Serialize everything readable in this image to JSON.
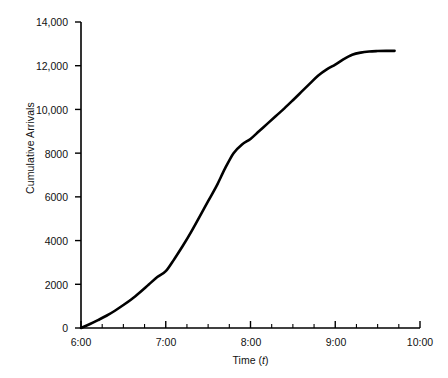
{
  "chart_data": {
    "type": "line",
    "title": "",
    "xlabel": "Time (t)",
    "xlabel_plain": "Time",
    "xlabel_variable": "t",
    "ylabel": "Cumulative Arrivals",
    "xlim": [
      6.0,
      10.0
    ],
    "ylim": [
      0,
      14000
    ],
    "grid": false,
    "legend": null,
    "line_color": "#000000",
    "axis_color": "#000000",
    "background_color": "#ffffff",
    "x_tick_labels": [
      "6:00",
      "7:00",
      "8:00",
      "9:00",
      "10:00"
    ],
    "x_tick_values": [
      6.0,
      7.0,
      8.0,
      9.0,
      10.0
    ],
    "x_minor_tick_interval_hours": 0.25,
    "y_tick_labels": [
      "0",
      "2000",
      "4000",
      "6000",
      "8000",
      "10,000",
      "12,000",
      "14,000"
    ],
    "y_tick_values": [
      0,
      2000,
      4000,
      6000,
      8000,
      10000,
      12000,
      14000
    ],
    "series": [
      {
        "name": "Cumulative Arrivals",
        "x": [
          6.0,
          6.1,
          6.2,
          6.3,
          6.4,
          6.5,
          6.6,
          6.7,
          6.8,
          6.9,
          7.0,
          7.1,
          7.2,
          7.3,
          7.4,
          7.5,
          7.6,
          7.7,
          7.8,
          7.9,
          8.0,
          8.1,
          8.2,
          8.3,
          8.4,
          8.5,
          8.6,
          8.7,
          8.8,
          8.9,
          9.0,
          9.1,
          9.2,
          9.3,
          9.4,
          9.5,
          9.6,
          9.7
        ],
        "values": [
          0,
          170,
          360,
          560,
          790,
          1050,
          1330,
          1650,
          1990,
          2330,
          2600,
          3150,
          3750,
          4400,
          5100,
          5800,
          6500,
          7300,
          8000,
          8400,
          8650,
          9000,
          9350,
          9700,
          10050,
          10420,
          10800,
          11180,
          11550,
          11830,
          12050,
          12300,
          12500,
          12600,
          12650,
          12670,
          12680,
          12680
        ]
      }
    ]
  }
}
